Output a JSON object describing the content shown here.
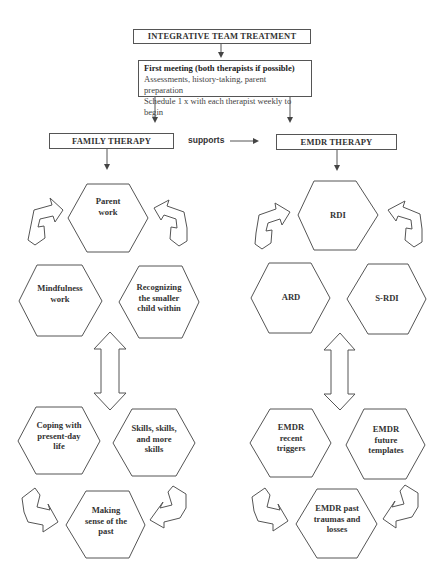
{
  "diagram": {
    "title": "INTEGRATIVE TEAM TREATMENT",
    "first_meeting": {
      "heading": "First meeting (both therapists if possible)",
      "line1": "Assessments, history-taking, parent preparation",
      "line2": "Schedule 1 x with each therapist weekly to begin"
    },
    "family_therapy": {
      "title": "FAMILY THERAPY",
      "hexagons": [
        {
          "label": "Parent work",
          "lines": [
            "Parent",
            "work"
          ]
        },
        {
          "label": "Mindfulness work",
          "lines": [
            "Mindfulness",
            "work"
          ]
        },
        {
          "label": "Recognizing the smaller child within",
          "lines": [
            "Recognizing",
            "the smaller",
            "child within"
          ]
        },
        {
          "label": "Coping with present-day life",
          "lines": [
            "Coping with",
            "present-day",
            "life"
          ]
        },
        {
          "label": "Skills, skills, and more skills",
          "lines": [
            "Skills, skills,",
            "and more",
            "skills"
          ]
        },
        {
          "label": "Making sense of the past",
          "lines": [
            "Making",
            "sense of the",
            "past"
          ]
        }
      ]
    },
    "connector_label": "supports",
    "emdr_therapy": {
      "title": "EMDR THERAPY",
      "hexagons": [
        {
          "label": "RDI",
          "lines": [
            "RDI"
          ]
        },
        {
          "label": "ARD",
          "lines": [
            "ARD"
          ]
        },
        {
          "label": "S-RDI",
          "lines": [
            "S-RDI"
          ]
        },
        {
          "label": "EMDR recent triggers",
          "lines": [
            "EMDR",
            "recent",
            "triggers"
          ]
        },
        {
          "label": "EMDR future templates",
          "lines": [
            "EMDR",
            "future",
            "templates"
          ]
        },
        {
          "label": "EMDR past traumas and losses",
          "lines": [
            "EMDR past",
            "traumas and",
            "losses"
          ]
        }
      ]
    },
    "colors": {
      "stroke": "#555555",
      "text": "#333333",
      "background": "#ffffff"
    }
  }
}
